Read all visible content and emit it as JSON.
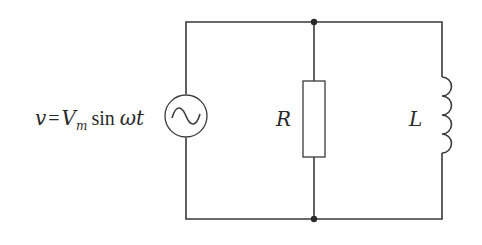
{
  "diagram": {
    "type": "circuit-schematic",
    "source": {
      "label_var": "v",
      "label_eq": "=",
      "label_amp": "V",
      "label_amp_sub": "m",
      "label_func": "sin",
      "label_arg": "ωt",
      "symbol": "ac-source-tilde"
    },
    "resistor": {
      "label": "R"
    },
    "inductor": {
      "label": "L",
      "turns": 4
    },
    "nodes": [
      {
        "name": "top-junction"
      },
      {
        "name": "bottom-junction"
      }
    ],
    "colors": {
      "wire": "#3a3a3a",
      "background": "#ffffff",
      "text": "#2a2a2a"
    }
  }
}
